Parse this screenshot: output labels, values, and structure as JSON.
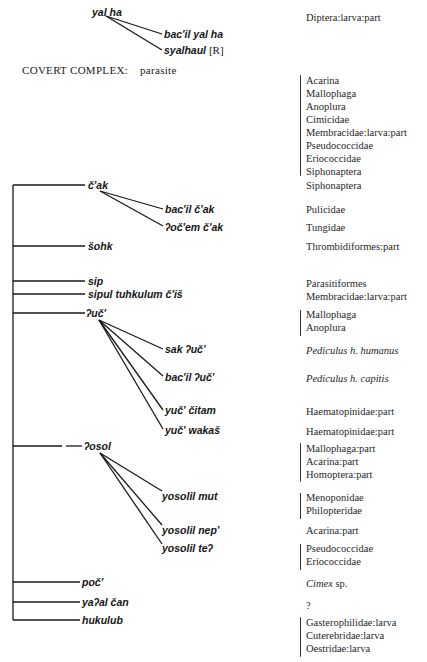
{
  "top_group": {
    "root": "yal ha",
    "children": [
      {
        "term": "bac'il yal ha",
        "mark": ""
      },
      {
        "term": "syalhaul",
        "mark": "[R]"
      }
    ],
    "gloss": "Diptera:larva:part"
  },
  "covert_complex": {
    "label": "COVERT COMPLEX:",
    "value": "parasite",
    "gloss": [
      "Acarina",
      "Mallophaga",
      "Anoplura",
      "Cimicidae",
      "Membracidae:larva:part",
      "Pseudococcidae",
      "Eriococcidae",
      "Siphonaptera"
    ]
  },
  "branches": [
    {
      "term": "č'ak",
      "gloss": [
        "Siphonaptera"
      ],
      "children": [
        {
          "term": "bac'il č'ak",
          "gloss": [
            "Pulicidae"
          ]
        },
        {
          "term": "ʔoč'em č'ak",
          "gloss": [
            "Tungidae"
          ]
        }
      ]
    },
    {
      "term": "šohk",
      "gloss": [
        "Thrombidiformes:part"
      ]
    },
    {
      "term": "sip",
      "gloss": [
        "Parasitiformes"
      ]
    },
    {
      "term": "sipul tuhkulum č'iš",
      "gloss": [
        "Membracidae:larva:part"
      ]
    },
    {
      "term": "ʔuč'",
      "gloss": [
        "Mallophaga",
        "Anoplura"
      ],
      "children": [
        {
          "term": "sak ʔuč'",
          "gloss": [
            "Pediculus h. humanus"
          ],
          "italic": true
        },
        {
          "term": "bac'il ʔuč'",
          "gloss": [
            "Pediculus h. capitis"
          ],
          "italic": true
        },
        {
          "term": "yuč' čitam",
          "gloss": [
            "Haematopinidae:part"
          ]
        },
        {
          "term": "yuč' wakaš",
          "gloss": [
            "Haematopinidae:part"
          ]
        }
      ]
    },
    {
      "term": "ʔosol",
      "gloss": [
        "Mallophaga:part",
        "Acarina:part",
        "Homoptera:part"
      ],
      "children": [
        {
          "term": "yosolil mut",
          "gloss": [
            "Menoponidae",
            "Philopteridae"
          ]
        },
        {
          "term": "yosolil nep'",
          "gloss": [
            "Acarina:part"
          ]
        },
        {
          "term": "yosolil teʔ",
          "gloss": [
            "Pseudococcidae",
            "Eriococcidae"
          ]
        }
      ]
    },
    {
      "term": "poč'",
      "gloss": [
        "Cimex",
        " sp."
      ]
    },
    {
      "term": "yaʔal čan",
      "gloss": [
        "?"
      ]
    },
    {
      "term": "hukulub",
      "gloss": [
        "Gasterophilidae:larva",
        "Cuterebridae:larva",
        "Oestridae:larva"
      ]
    }
  ]
}
